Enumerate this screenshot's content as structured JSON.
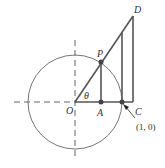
{
  "diagram": {
    "title": "",
    "labels": {
      "origin": "O",
      "point_a": "A",
      "point_p": "P",
      "point_c": "C",
      "point_d": "D",
      "angle": "θ",
      "unit_point": "(1, 0)"
    },
    "colors": {
      "stroke": "#555555",
      "point": "#444444",
      "text": "#333333",
      "background": "#ffffff"
    },
    "elements": [
      "unit circle centered at O",
      "dashed x-axis (negative side)",
      "dashed y-axis",
      "ray from O through P to D",
      "segment P to A (vertical)",
      "segment O to C (horizontal)",
      "vertical line at (1,0) up to ray",
      "vertical line C to D",
      "arrow pointing to (1,0)"
    ]
  }
}
